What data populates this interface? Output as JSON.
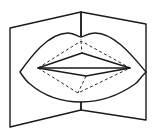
{
  "diagram": {
    "colors": {
      "stroke": "#1a1a1a",
      "background": "#ffffff"
    },
    "card": {
      "left_panel": [
        [
          10,
          28
        ],
        [
          81,
          12
        ],
        [
          81,
          110
        ],
        [
          10,
          127
        ]
      ],
      "right_panel": [
        [
          81,
          12
        ],
        [
          146,
          24
        ],
        [
          146,
          120
        ],
        [
          81,
          110
        ]
      ],
      "center_fold_dashed": [
        [
          81,
          12
        ],
        [
          81,
          41
        ]
      ],
      "center_fold_lower_dashed": [
        [
          81,
          101
        ],
        [
          81,
          110
        ]
      ]
    },
    "lips": {
      "outer_path": "M20,72 C30,58 48,33 68,33 C75,33 78,37 81,37 C84,37 87,33 95,33 C115,33 134,58 146,72 C140,78 138,82 135,84 C118,96 100,102 81,102 C62,102 44,96 30,84 C27,82 24,78 20,72 Z",
      "mouth_solid": [
        [
          38,
          68
        ],
        [
          82,
          53
        ],
        [
          130,
          68
        ],
        [
          86,
          76
        ],
        [
          38,
          68
        ]
      ],
      "mouth_center_line": [
        [
          38,
          68
        ],
        [
          130,
          68
        ]
      ],
      "fold_dashed_top": [
        [
          38,
          68
        ],
        [
          81,
          41
        ],
        [
          130,
          68
        ]
      ],
      "fold_dashed_bottom": [
        [
          38,
          68
        ],
        [
          78,
          93
        ],
        [
          130,
          68
        ]
      ],
      "fold_dashed_verticals": [
        [
          [
            81,
            41
          ],
          [
            82,
            53
          ]
        ],
        [
          [
            86,
            76
          ],
          [
            78,
            93
          ]
        ]
      ]
    }
  }
}
